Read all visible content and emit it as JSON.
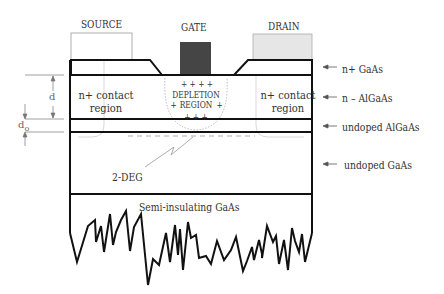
{
  "diagram": {
    "title": "",
    "type": "HEMT device cross-section",
    "contacts": {
      "source": {
        "label": "SOURCE",
        "fill": "#ffffff"
      },
      "gate": {
        "label": "GATE",
        "fill": "#444444"
      },
      "drain": {
        "label": "DRAIN",
        "fill": "#e4e4e4"
      }
    },
    "regions": {
      "left_contact": {
        "line1": "n+ contact",
        "line2": "region"
      },
      "right_contact": {
        "line1": "n+ contact",
        "line2": "region"
      },
      "depletion": {
        "line1": "DEPLETION",
        "line2": "REGION",
        "plus_top": "+   +   +   +",
        "plus_side_left": "+",
        "plus_side_right": "+",
        "plus_bottom": "+   +   +"
      },
      "channel": {
        "label": "2-DEG"
      },
      "substrate": {
        "label": "Semi-insulating GaAs"
      }
    },
    "layers": [
      {
        "label": "n+ GaAs"
      },
      {
        "label": "n – AlGaAs"
      },
      {
        "label": "undoped AlGaAs"
      },
      {
        "label": "undoped GaAs"
      }
    ],
    "dimensions": {
      "d": "d",
      "d0": "d",
      "d0_sub": "o"
    },
    "colors": {
      "outline": "#111111",
      "thin_line": "#999999",
      "text": "#333333"
    }
  }
}
